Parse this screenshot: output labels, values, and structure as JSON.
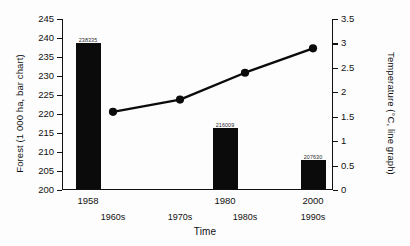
{
  "chart_data": {
    "type": "bar",
    "title": "",
    "xlabel": "Time",
    "ylabel": "Forest (1 000 ha, bar chart)",
    "ylabel_right": "Temperature (°C, line graph)",
    "grid": false,
    "legend": "none",
    "ylim": [
      200,
      245
    ],
    "ylim_right": [
      0,
      3.5
    ],
    "yticks": [
      "245",
      "240",
      "235",
      "230",
      "225",
      "220",
      "215",
      "210",
      "205",
      "200"
    ],
    "ytick_values": [
      245,
      240,
      235,
      230,
      225,
      220,
      215,
      210,
      205,
      200
    ],
    "yticks_right": [
      "3.5",
      "3",
      "2.5",
      "2",
      "1.5",
      "1",
      "0.5",
      "0"
    ],
    "ytick_values_right": [
      3.5,
      3,
      2.5,
      2,
      1.5,
      1,
      0.5,
      0
    ],
    "xtick_years": [
      "1958",
      "1980",
      "2000"
    ],
    "xtick_decades": [
      "1960s",
      "1970s",
      "1980s",
      "1990s"
    ],
    "series": [
      {
        "name": "Forest (1 000 ha, bar chart)",
        "kind": "bar",
        "axis": "left",
        "color": "#0b0b0b",
        "categories": [
          "1958",
          "1980",
          "2000"
        ],
        "values": [
          238.335,
          216.009,
          207.63
        ],
        "data_labels": [
          "238335",
          "216009",
          "207630"
        ]
      },
      {
        "name": "Temperature (°C, line graph)",
        "kind": "line",
        "axis": "right",
        "color": "#0b0b0b",
        "categories": [
          "1960s",
          "1970s",
          "1980s",
          "1990s"
        ],
        "values": [
          1.6,
          1.85,
          2.4,
          2.9
        ]
      }
    ]
  }
}
